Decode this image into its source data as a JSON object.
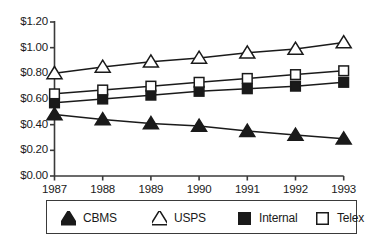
{
  "chart_data": {
    "type": "line",
    "title": "",
    "xlabel": "",
    "ylabel": "",
    "categories": [
      "1987",
      "1988",
      "1989",
      "1990",
      "1991",
      "1992",
      "1993"
    ],
    "ylim": [
      0.0,
      1.2
    ],
    "ytick_values": [
      1.2,
      1.0,
      0.8,
      0.6,
      0.4,
      0.2,
      0.0
    ],
    "ytick_labels": [
      "$1.20",
      "$1.00",
      "$0.80",
      "$0.60",
      "$0.40",
      "$0.20",
      "$0.00"
    ],
    "grid": false,
    "legend_position": "bottom",
    "series": [
      {
        "name": "CBMS",
        "marker": "filled-triangle",
        "color": "#1a1a1a",
        "values": [
          0.48,
          0.44,
          0.41,
          0.39,
          0.35,
          0.32,
          0.29
        ]
      },
      {
        "name": "USPS",
        "marker": "open-triangle",
        "color": "#1a1a1a",
        "values": [
          0.8,
          0.85,
          0.89,
          0.92,
          0.96,
          0.99,
          1.04
        ]
      },
      {
        "name": "Internal",
        "marker": "filled-square",
        "color": "#1a1a1a",
        "values": [
          0.57,
          0.6,
          0.63,
          0.66,
          0.68,
          0.7,
          0.73
        ]
      },
      {
        "name": "Telex",
        "marker": "open-square",
        "color": "#1a1a1a",
        "values": [
          0.64,
          0.67,
          0.7,
          0.73,
          0.76,
          0.79,
          0.82
        ]
      }
    ]
  },
  "legend": {
    "items": [
      {
        "label": "CBMS",
        "marker": "filled-triangle"
      },
      {
        "label": "USPS",
        "marker": "open-triangle"
      },
      {
        "label": "Internal",
        "marker": "filled-square"
      },
      {
        "label": "Telex",
        "marker": "open-square"
      }
    ]
  },
  "colors": {
    "ink": "#1a1a1a",
    "axis": "#3a3a3a",
    "background": "#ffffff"
  }
}
